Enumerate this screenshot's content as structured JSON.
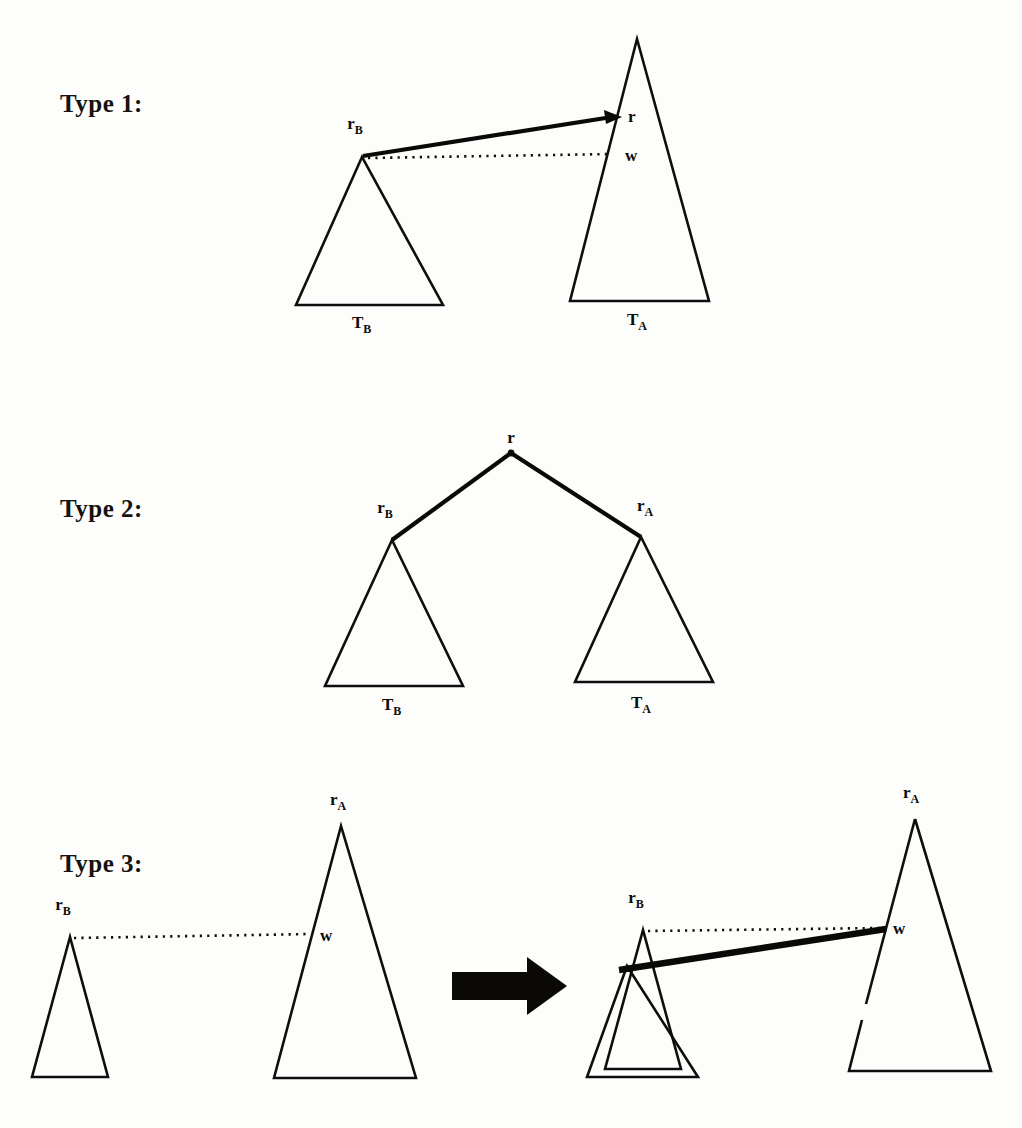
{
  "figure": {
    "background_color": "#fdfdfc",
    "ink_color": "#100e0c",
    "caption_font": "serif-bold"
  },
  "rows": [
    {
      "id": "type-1",
      "label": "Type 1:",
      "label_x": 60,
      "label_y": 112,
      "description": "Left subtree T_B with root r_B joined by a bold arrow to node r on the right subtree T_A; a dotted reference line from r_B meets the right subtree at w.",
      "shapes": {
        "left_triangle": {
          "name": "T_B",
          "apex": [
            362,
            157
          ],
          "base_left": [
            296,
            305
          ],
          "base_right": [
            443,
            305
          ],
          "caption": "T",
          "caption_sub": "B",
          "caption_x": 352,
          "caption_y": 328
        },
        "right_triangle": {
          "name": "T_A",
          "apex": [
            637,
            39
          ],
          "base_left": [
            570,
            301
          ],
          "base_right": [
            709,
            301
          ],
          "caption": "T",
          "caption_sub": "A",
          "caption_x": 627,
          "caption_y": 325
        },
        "solid_edge": {
          "from": [
            363,
            157
          ],
          "to": [
            620,
            117
          ],
          "arrow": true
        },
        "dotted_edge": {
          "from": [
            366,
            158
          ],
          "to": [
            616,
            154
          ]
        }
      },
      "node_labels": [
        {
          "text": "r",
          "sub": "B",
          "x": 355,
          "y": 129,
          "anchor": "middle"
        },
        {
          "text": "r",
          "sub": "",
          "x": 628,
          "y": 122,
          "anchor": "start"
        },
        {
          "text": "w",
          "sub": "",
          "x": 625,
          "y": 161,
          "anchor": "start"
        }
      ]
    },
    {
      "id": "type-2",
      "label": "Type 2:",
      "label_x": 60,
      "label_y": 517,
      "description": "A new root r with two bold edges descending to roots r_B (left subtree T_B) and r_A (right subtree T_A).",
      "shapes": {
        "left_triangle": {
          "name": "T_B",
          "apex": [
            392,
            540
          ],
          "base_left": [
            325,
            686
          ],
          "base_right": [
            463,
            686
          ],
          "caption": "T",
          "caption_sub": "B",
          "caption_x": 382,
          "caption_y": 710
        },
        "right_triangle": {
          "name": "T_A",
          "apex": [
            641,
            537
          ],
          "base_left": [
            575,
            682
          ],
          "base_right": [
            713,
            682
          ],
          "caption": "T",
          "caption_sub": "A",
          "caption_x": 631,
          "caption_y": 708
        },
        "root": [
          511,
          453
        ],
        "edge_left": {
          "from": [
            511,
            453
          ],
          "to": [
            392,
            540
          ]
        },
        "edge_right": {
          "from": [
            511,
            453
          ],
          "to": [
            641,
            537
          ]
        }
      },
      "node_labels": [
        {
          "text": "r",
          "sub": "",
          "x": 511,
          "y": 443,
          "anchor": "middle"
        },
        {
          "text": "r",
          "sub": "B",
          "x": 385,
          "y": 513,
          "anchor": "middle"
        },
        {
          "text": "r",
          "sub": "A",
          "x": 645,
          "y": 511,
          "anchor": "middle"
        }
      ]
    },
    {
      "id": "type-3",
      "label": "Type 3:",
      "label_x": 60,
      "label_y": 872,
      "description": "Before: a narrow subtree rooted at r_B and a separate subtree T_A with attachment point w linked only by a dotted line. After the transformation (big arrow): the two subtrees are merged, the r_B subtree overlapping T_A and a bold edge drawn to w.",
      "before": {
        "small_triangle": {
          "name": "r_B-subtree",
          "apex": [
            70,
            937
          ],
          "base_left": [
            32,
            1077
          ],
          "base_right": [
            108,
            1077
          ]
        },
        "big_triangle": {
          "name": "T_A",
          "apex": [
            341,
            826
          ],
          "base_left": [
            274,
            1078
          ],
          "base_right": [
            416,
            1078
          ]
        },
        "dotted_edge": {
          "from": [
            73,
            938
          ],
          "to": [
            311,
            934
          ]
        },
        "node_labels": [
          {
            "text": "r",
            "sub": "B",
            "x": 63,
            "y": 910,
            "anchor": "middle"
          },
          {
            "text": "r",
            "sub": "A",
            "x": 338,
            "y": 805,
            "anchor": "middle"
          },
          {
            "text": "w",
            "sub": "",
            "x": 320,
            "y": 941,
            "anchor": "start"
          }
        ]
      },
      "transform_arrow": {
        "name": "right-arrow",
        "shaft": [
          452,
          972,
          77,
          28
        ],
        "head": [
          [
            529,
            958
          ],
          [
            566,
            986
          ],
          [
            529,
            1014
          ]
        ]
      },
      "after": {
        "small_triangle": {
          "name": "r_B-subtree",
          "apex": [
            643,
            930
          ],
          "base_left": [
            605,
            1069
          ],
          "base_right": [
            681,
            1069
          ]
        },
        "overlap_triangle": {
          "name": "merged-subtree",
          "apex": [
            627,
            966
          ],
          "base_left": [
            587,
            1077
          ],
          "base_right": [
            698,
            1077
          ]
        },
        "big_triangle": {
          "name": "T_A",
          "apex": [
            915,
            819
          ],
          "base_left": [
            849,
            1071
          ],
          "base_right": [
            991,
            1071
          ]
        },
        "dotted_edge": {
          "from": [
            646,
            931
          ],
          "to": [
            884,
            927
          ]
        },
        "bold_edge": {
          "from": [
            620,
            969
          ],
          "to": [
            886,
            929
          ]
        },
        "node_labels": [
          {
            "text": "r",
            "sub": "B",
            "x": 636,
            "y": 903,
            "anchor": "middle"
          },
          {
            "text": "r",
            "sub": "A",
            "x": 911,
            "y": 798,
            "anchor": "middle"
          },
          {
            "text": "w",
            "sub": "",
            "x": 893,
            "y": 934,
            "anchor": "start"
          }
        ]
      }
    }
  ]
}
